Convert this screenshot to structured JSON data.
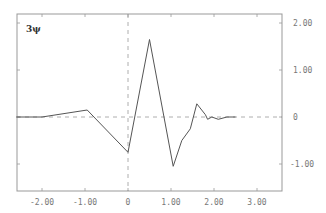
{
  "chart_data": {
    "type": "line",
    "title": "",
    "xlabel": "",
    "ylabel": "3ψ",
    "xlim": [
      -2.6,
      3.6
    ],
    "ylim": [
      -1.6,
      2.1
    ],
    "grid": false,
    "legend": null,
    "x_ticks": [
      -2,
      -1,
      0,
      1,
      2,
      3
    ],
    "x_tick_labels": [
      "-2.00",
      "-1.00",
      "0",
      "1.00",
      "2.00",
      "3.00"
    ],
    "y_ticks": [
      2,
      1,
      0,
      -1
    ],
    "y_tick_labels": [
      "2.00",
      "1.00",
      "0",
      "-1.00"
    ],
    "y_axis_side": "right",
    "reference_lines": [
      {
        "orientation": "horizontal",
        "value": 0,
        "style": "dashed"
      },
      {
        "orientation": "vertical",
        "value": 0,
        "style": "dashed"
      }
    ],
    "series": [
      {
        "name": "3ψ",
        "x": [
          -2.6,
          -2.0,
          -0.95,
          0.0,
          0.5,
          1.05,
          1.25,
          1.45,
          1.6,
          1.8,
          1.85,
          1.95,
          2.1,
          2.3,
          2.5
        ],
        "y": [
          0.0,
          0.0,
          0.15,
          -0.75,
          1.65,
          -1.05,
          -0.5,
          -0.25,
          0.28,
          0.05,
          -0.05,
          0.0,
          -0.05,
          0.0,
          0.0
        ]
      }
    ]
  },
  "colors": {
    "line": "#555555",
    "axis": "#888888",
    "dash": "#888888",
    "text": "#777777"
  }
}
